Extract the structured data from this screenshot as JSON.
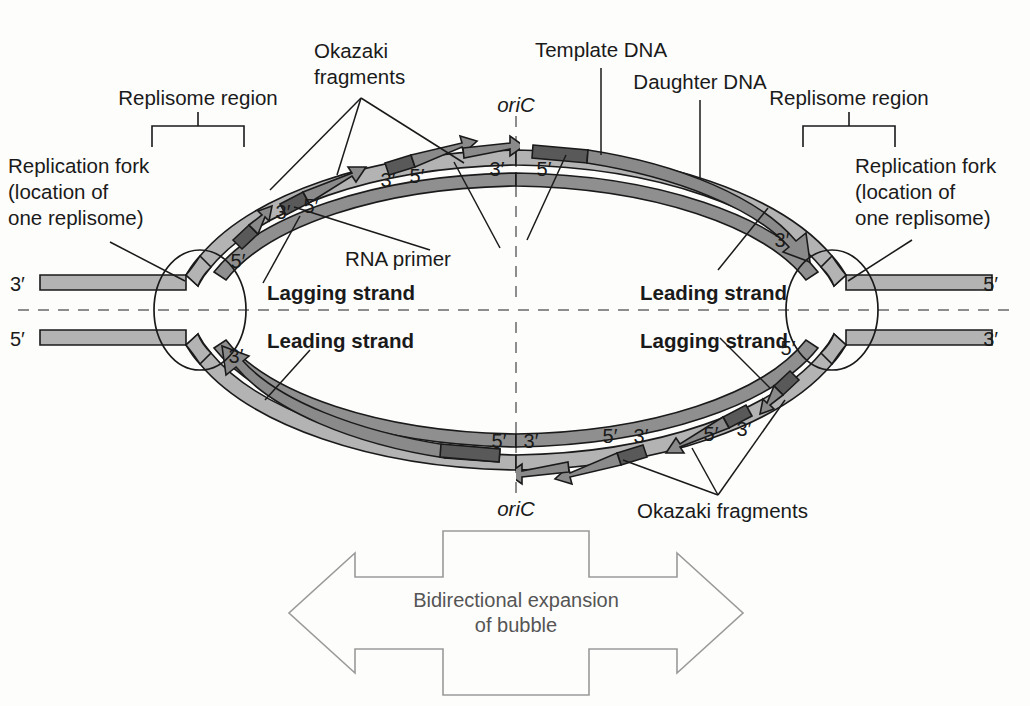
{
  "figure": {
    "background_color": "#fdfdfc"
  },
  "colors": {
    "template_strand": "#b3b3b3",
    "daughter_strand": "#8f8f8f",
    "rna_primer": "#595959",
    "okazaki_arrow": "#8a8a8a",
    "outline": "#1a1a1a",
    "axis_dash": "#8d8d8d",
    "bidirectional_arrow_stroke": "#9a9a9a",
    "bidirectional_arrow_text": "#555555"
  },
  "labels": {
    "okazaki_top": "Okazaki\nfragments",
    "okazaki_top_line1": "Okazaki",
    "okazaki_top_line2": "fragments",
    "okazaki_bottom": "Okazaki fragments",
    "template_dna": "Template DNA",
    "daughter_dna": "Daughter DNA",
    "replisome_region_left": "Replisome region",
    "replisome_region_right": "Replisome region",
    "replication_fork_left_line1": "Replication fork",
    "replication_fork_left_line2": "(location of",
    "replication_fork_left_line3": "one replisome)",
    "replication_fork_right_line1": "Replication fork",
    "replication_fork_right_line2": "(location of",
    "replication_fork_right_line3": "one replisome)",
    "rna_primer": "RNA primer",
    "oric_top": "oriC",
    "oric_bottom": "oriC",
    "lagging_strand_upper_left": "Lagging strand",
    "leading_strand_lower_left": "Leading strand",
    "leading_strand_upper_right": "Leading strand",
    "lagging_strand_lower_right": "Lagging strand",
    "bidirectional_line1": "Bidirectional expansion",
    "bidirectional_line2": "of bubble"
  },
  "end_labels": {
    "far_left_top": "3′",
    "far_left_bottom": "5′",
    "far_right_top": "5′",
    "far_right_bottom": "3′"
  },
  "prime_marks": {
    "upper_left_quadrant": [
      {
        "text": "5′",
        "x": 238,
        "y": 268
      },
      {
        "text": "3′",
        "x": 283,
        "y": 219
      },
      {
        "text": "5′",
        "x": 311,
        "y": 213
      },
      {
        "text": "3′",
        "x": 388,
        "y": 187
      },
      {
        "text": "5′",
        "x": 417,
        "y": 183
      },
      {
        "text": "3′",
        "x": 497,
        "y": 176
      }
    ],
    "upper_right_quadrant": [
      {
        "text": "5′",
        "x": 544,
        "y": 176
      },
      {
        "text": "3′",
        "x": 782,
        "y": 247
      }
    ],
    "lower_left_quadrant": [
      {
        "text": "3′",
        "x": 236,
        "y": 363
      }
    ],
    "lower_right_quadrant": [
      {
        "text": "5′",
        "x": 788,
        "y": 355
      },
      {
        "text": "3′",
        "x": 744,
        "y": 436
      },
      {
        "text": "5′",
        "x": 711,
        "y": 441
      },
      {
        "text": "3′",
        "x": 641,
        "y": 443
      },
      {
        "text": "5′",
        "x": 610,
        "y": 443
      },
      {
        "text": "3′",
        "x": 531,
        "y": 448
      },
      {
        "text": "5′",
        "x": 499,
        "y": 448
      }
    ]
  },
  "structures": {
    "bubble": {
      "cx": 516,
      "cy": 310,
      "rx": 345,
      "ry": 160
    },
    "fork_left": {
      "cx": 200,
      "cy": 310,
      "rx": 46,
      "ry": 60
    },
    "fork_right": {
      "cx": 832,
      "cy": 310,
      "rx": 46,
      "ry": 60
    },
    "okazaki_fragment_count_top_left": 4,
    "okazaki_fragment_count_bottom_right": 4,
    "leading_strand_count": 2,
    "lagging_strand_count": 2
  }
}
